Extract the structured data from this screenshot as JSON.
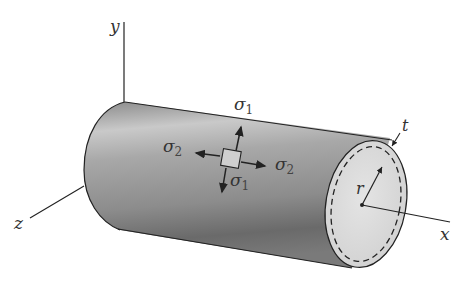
{
  "figure": {
    "axes": {
      "x_label": "x",
      "y_label": "y",
      "z_label": "z"
    },
    "stresses": {
      "sigma1_top": {
        "symbol": "σ",
        "subscript": "1"
      },
      "sigma1_bottom": {
        "symbol": "σ",
        "subscript": "1"
      },
      "sigma2_left": {
        "symbol": "σ",
        "subscript": "2"
      },
      "sigma2_right": {
        "symbol": "σ",
        "subscript": "2"
      }
    },
    "dimensions": {
      "radius_label": "r",
      "thickness_label": "t"
    },
    "colors": {
      "cylinder_dark": "#6e6e6e",
      "cylinder_light": "#cfcfcf",
      "end_cap": "#d9d9d9",
      "line": "#222222",
      "background": "#ffffff"
    }
  }
}
